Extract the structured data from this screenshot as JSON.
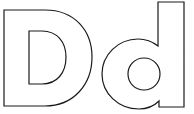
{
  "artwork": {
    "letters": [
      "D",
      "d"
    ],
    "style": "outline",
    "stroke_color": "#1a1a1a",
    "fill_color": "#ffffff",
    "background": "#ffffff"
  }
}
